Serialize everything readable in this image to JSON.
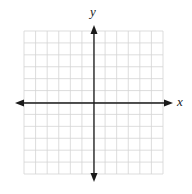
{
  "diagram": {
    "type": "coordinate-plane",
    "x_label": "x",
    "y_label": "y",
    "grid": {
      "columns": 12,
      "rows": 12,
      "left": 24,
      "top": 31,
      "right": 163,
      "bottom": 174,
      "color": "#d4d4d4"
    },
    "axes": {
      "origin_x": 94,
      "origin_y": 103,
      "x_start": 15,
      "x_end": 173,
      "y_start": 25,
      "y_end": 182,
      "color": "#1a1a1a"
    }
  }
}
